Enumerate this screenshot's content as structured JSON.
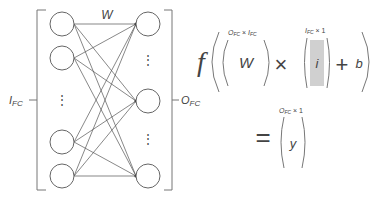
{
  "diagram": {
    "weight_label": "W",
    "input_label": "I",
    "input_label_sub": "FC",
    "output_label": "O",
    "output_label_sub": "FC",
    "input_nodes_y": [
      24,
      58,
      142,
      176
    ],
    "output_nodes_y": [
      24,
      101,
      176
    ],
    "ellipsis": "⋮",
    "colors": {
      "stroke": "#666666",
      "line": "#555555",
      "shade": "#d0d0d0",
      "text": "#444444"
    }
  },
  "equation": {
    "func": "f",
    "matrix_W": "W",
    "matrix_W_dim": "O",
    "matrix_W_dim_sub1": "FC",
    "matrix_W_dim_times": "×",
    "matrix_W_dim2": "I",
    "matrix_W_dim_sub2": "FC",
    "times": "×",
    "vector_i": "i",
    "vector_i_dim": "I",
    "vector_i_dim_sub": "FC",
    "vector_i_dim_rest": "× 1",
    "plus": "+",
    "bias": "b",
    "equals": "=",
    "result_y": "y",
    "result_dim": "O",
    "result_dim_sub": "FC",
    "result_dim_rest": "× 1"
  }
}
